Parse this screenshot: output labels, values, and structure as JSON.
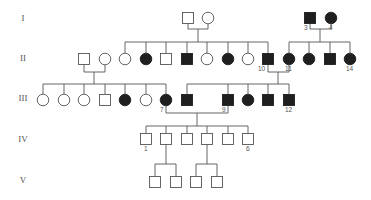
{
  "generations": [
    {
      "label": "I",
      "y": 19
    },
    {
      "label": "II",
      "y": 59
    },
    {
      "label": "III",
      "y": 99
    },
    {
      "label": "IV",
      "y": 140
    },
    {
      "label": "V",
      "y": 181
    }
  ],
  "colors": {
    "line": "#555555",
    "affected": "#1f1f1f",
    "unaffected": "#ffffff"
  },
  "individuals": [
    {
      "id": "I-a",
      "gen": "I",
      "sex": "male",
      "affected": false,
      "x": 188,
      "y": 18
    },
    {
      "id": "I-b",
      "gen": "I",
      "sex": "female",
      "affected": false,
      "x": 208,
      "y": 18
    },
    {
      "id": "I-3",
      "gen": "I",
      "sex": "male",
      "affected": true,
      "x": 310,
      "y": 18,
      "label": "3"
    },
    {
      "id": "I-4",
      "gen": "I",
      "sex": "female",
      "affected": true,
      "x": 331,
      "y": 18,
      "label": "4"
    },
    {
      "id": "II-a",
      "gen": "II",
      "sex": "male",
      "affected": false,
      "x": 84,
      "y": 59
    },
    {
      "id": "II-b",
      "gen": "II",
      "sex": "female",
      "affected": false,
      "x": 105,
      "y": 59
    },
    {
      "id": "II-c",
      "gen": "II",
      "sex": "female",
      "affected": false,
      "x": 125,
      "y": 59
    },
    {
      "id": "II-d",
      "gen": "II",
      "sex": "female",
      "affected": true,
      "x": 146,
      "y": 59
    },
    {
      "id": "II-e",
      "gen": "II",
      "sex": "male",
      "affected": false,
      "x": 166,
      "y": 59
    },
    {
      "id": "II-f",
      "gen": "II",
      "sex": "male",
      "affected": true,
      "x": 187,
      "y": 59
    },
    {
      "id": "II-g",
      "gen": "II",
      "sex": "female",
      "affected": false,
      "x": 207,
      "y": 59
    },
    {
      "id": "II-h",
      "gen": "II",
      "sex": "female",
      "affected": true,
      "x": 228,
      "y": 59
    },
    {
      "id": "II-i",
      "gen": "II",
      "sex": "female",
      "affected": false,
      "x": 248,
      "y": 59
    },
    {
      "id": "II-10",
      "gen": "II",
      "sex": "male",
      "affected": true,
      "x": 268,
      "y": 59,
      "label": "10"
    },
    {
      "id": "II-11",
      "gen": "II",
      "sex": "female",
      "affected": true,
      "x": 289,
      "y": 59,
      "label": "11"
    },
    {
      "id": "II-12",
      "gen": "II",
      "sex": "female",
      "affected": true,
      "x": 309,
      "y": 59
    },
    {
      "id": "II-13",
      "gen": "II",
      "sex": "male",
      "affected": true,
      "x": 330,
      "y": 59
    },
    {
      "id": "II-14",
      "gen": "II",
      "sex": "female",
      "affected": true,
      "x": 350,
      "y": 59,
      "label": "14"
    },
    {
      "id": "III-1",
      "gen": "III",
      "sex": "female",
      "affected": false,
      "x": 43,
      "y": 100
    },
    {
      "id": "III-2",
      "gen": "III",
      "sex": "female",
      "affected": false,
      "x": 64,
      "y": 100
    },
    {
      "id": "III-3",
      "gen": "III",
      "sex": "female",
      "affected": false,
      "x": 84,
      "y": 100
    },
    {
      "id": "III-4",
      "gen": "III",
      "sex": "male",
      "affected": false,
      "x": 105,
      "y": 100
    },
    {
      "id": "III-5",
      "gen": "III",
      "sex": "female",
      "affected": true,
      "x": 125,
      "y": 100
    },
    {
      "id": "III-6",
      "gen": "III",
      "sex": "female",
      "affected": false,
      "x": 146,
      "y": 100
    },
    {
      "id": "III-7",
      "gen": "III",
      "sex": "female",
      "affected": true,
      "x": 166,
      "y": 100,
      "label": "7"
    },
    {
      "id": "III-8",
      "gen": "III",
      "sex": "male",
      "affected": true,
      "x": 187,
      "y": 100
    },
    {
      "id": "III-9",
      "gen": "III",
      "sex": "male",
      "affected": true,
      "x": 228,
      "y": 100,
      "label": "9"
    },
    {
      "id": "III-10",
      "gen": "III",
      "sex": "female",
      "affected": true,
      "x": 248,
      "y": 100
    },
    {
      "id": "III-11",
      "gen": "III",
      "sex": "male",
      "affected": true,
      "x": 268,
      "y": 100
    },
    {
      "id": "III-12",
      "gen": "III",
      "sex": "male",
      "affected": true,
      "x": 289,
      "y": 100,
      "label": "12"
    },
    {
      "id": "IV-1",
      "gen": "IV",
      "sex": "male",
      "affected": false,
      "x": 146,
      "y": 139,
      "label": "1"
    },
    {
      "id": "IV-2",
      "gen": "IV",
      "sex": "male",
      "affected": false,
      "x": 166,
      "y": 139
    },
    {
      "id": "IV-3",
      "gen": "IV",
      "sex": "male",
      "affected": false,
      "x": 187,
      "y": 139
    },
    {
      "id": "IV-4",
      "gen": "IV",
      "sex": "male",
      "affected": false,
      "x": 207,
      "y": 139
    },
    {
      "id": "IV-5",
      "gen": "IV",
      "sex": "male",
      "affected": false,
      "x": 228,
      "y": 139
    },
    {
      "id": "IV-6",
      "gen": "IV",
      "sex": "male",
      "affected": false,
      "x": 248,
      "y": 139,
      "label": "6"
    },
    {
      "id": "V-1",
      "gen": "V",
      "sex": "male",
      "affected": false,
      "x": 155,
      "y": 182
    },
    {
      "id": "V-2",
      "gen": "V",
      "sex": "male",
      "affected": false,
      "x": 176,
      "y": 182
    },
    {
      "id": "V-3",
      "gen": "V",
      "sex": "male",
      "affected": false,
      "x": 196,
      "y": 182
    },
    {
      "id": "V-4",
      "gen": "V",
      "sex": "male",
      "affected": false,
      "x": 217,
      "y": 182
    }
  ],
  "lines": [
    [
      188,
      24,
      188,
      29
    ],
    [
      208,
      24,
      208,
      29
    ],
    [
      188,
      29,
      208,
      29
    ],
    [
      198,
      29,
      198,
      42
    ],
    [
      125,
      42,
      268,
      42
    ],
    [
      125,
      42,
      125,
      53
    ],
    [
      146,
      42,
      146,
      53
    ],
    [
      166,
      42,
      166,
      53
    ],
    [
      187,
      42,
      187,
      53
    ],
    [
      207,
      42,
      207,
      53
    ],
    [
      228,
      42,
      228,
      53
    ],
    [
      248,
      42,
      248,
      53
    ],
    [
      268,
      42,
      268,
      53
    ],
    [
      310,
      24,
      310,
      29
    ],
    [
      331,
      24,
      331,
      29
    ],
    [
      310,
      29,
      331,
      29
    ],
    [
      320,
      29,
      320,
      42
    ],
    [
      289,
      42,
      350,
      42
    ],
    [
      289,
      42,
      289,
      53
    ],
    [
      309,
      42,
      309,
      53
    ],
    [
      330,
      42,
      330,
      53
    ],
    [
      350,
      42,
      350,
      53
    ],
    [
      84,
      65,
      84,
      72
    ],
    [
      105,
      65,
      105,
      72
    ],
    [
      84,
      72,
      105,
      72
    ],
    [
      94,
      72,
      94,
      84
    ],
    [
      43,
      84,
      166,
      84
    ],
    [
      43,
      84,
      43,
      94
    ],
    [
      64,
      84,
      64,
      94
    ],
    [
      84,
      84,
      84,
      94
    ],
    [
      105,
      84,
      105,
      94
    ],
    [
      125,
      84,
      125,
      94
    ],
    [
      146,
      84,
      146,
      94
    ],
    [
      166,
      84,
      166,
      94
    ],
    [
      268,
      65,
      268,
      72
    ],
    [
      289,
      65,
      289,
      72
    ],
    [
      268,
      72,
      289,
      72
    ],
    [
      278,
      72,
      278,
      84
    ],
    [
      187,
      84,
      289,
      84
    ],
    [
      187,
      84,
      187,
      94
    ],
    [
      228,
      84,
      228,
      94
    ],
    [
      248,
      84,
      248,
      94
    ],
    [
      268,
      84,
      268,
      94
    ],
    [
      289,
      84,
      289,
      94
    ],
    [
      166,
      106,
      166,
      113
    ],
    [
      228,
      106,
      228,
      113
    ],
    [
      166,
      113,
      228,
      113
    ],
    [
      197,
      113,
      197,
      126
    ],
    [
      146,
      126,
      248,
      126
    ],
    [
      146,
      126,
      146,
      134
    ],
    [
      166,
      126,
      166,
      134
    ],
    [
      187,
      126,
      187,
      134
    ],
    [
      207,
      126,
      207,
      134
    ],
    [
      228,
      126,
      228,
      134
    ],
    [
      248,
      126,
      248,
      134
    ],
    [
      166,
      144,
      166,
      164
    ],
    [
      155,
      164,
      176,
      164
    ],
    [
      155,
      164,
      155,
      177
    ],
    [
      176,
      164,
      176,
      177
    ],
    [
      207,
      144,
      207,
      164
    ],
    [
      196,
      164,
      217,
      164
    ],
    [
      196,
      164,
      196,
      177
    ],
    [
      217,
      164,
      217,
      177
    ]
  ]
}
